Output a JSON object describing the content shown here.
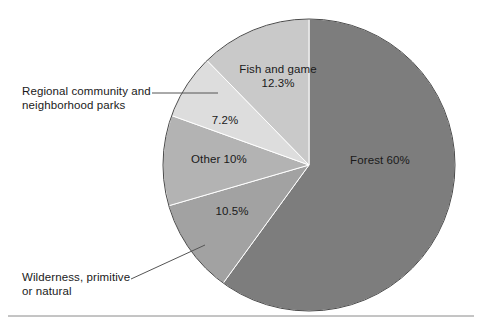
{
  "chart_data": {
    "type": "pie",
    "title": "",
    "subtitle": "",
    "xlabel": "",
    "ylabel": "",
    "legend_position": "none",
    "grid": false,
    "units": "percent",
    "start_angle_deg": 0,
    "direction": "clockwise",
    "categories": [
      "Forest",
      "Wilderness, primitive or natural",
      "Other",
      "Regional community and neighborhood parks",
      "Fish and game"
    ],
    "values": [
      60,
      10.5,
      10,
      7.2,
      12.3
    ],
    "slices": [
      {
        "name": "Forest",
        "label": "Forest 60%",
        "value": 60,
        "value_text": "60%",
        "color": "#7d7d7d",
        "label_placement": "inside"
      },
      {
        "name": "Wilderness, primitive or natural",
        "label": "Wilderness, primitive\nor natural",
        "value": 10.5,
        "value_text": "10.5%",
        "color": "#a2a2a2",
        "label_placement": "callout-left"
      },
      {
        "name": "Other",
        "label": "Other 10%",
        "value": 10,
        "value_text": "10%",
        "color": "#b3b3b3",
        "label_placement": "inside"
      },
      {
        "name": "Regional community and neighborhood parks",
        "label": "Regional community and\nneighborhood parks",
        "value": 7.2,
        "value_text": "7.2%",
        "color": "#dddddd",
        "label_placement": "callout-left"
      },
      {
        "name": "Fish and game",
        "label": "Fish and game\n12.3%",
        "value": 12.3,
        "value_text": "12.3%",
        "color": "#c9c9c9",
        "label_placement": "inside"
      }
    ]
  },
  "figure": {
    "background_color": "#ffffff",
    "outline_color": "#4a4a4a",
    "rule_color": "#8a8a8a"
  },
  "labels": {
    "regional_line1": "Regional community and",
    "regional_line2": "neighborhood parks",
    "wilderness_line1": "Wilderness, primitive",
    "wilderness_line2": "or natural",
    "fish_line1": "Fish and game",
    "fish_line2": "12.3%",
    "regional_pct": "7.2%",
    "other": "Other 10%",
    "wilderness_pct": "10.5%",
    "forest": "Forest 60%"
  }
}
